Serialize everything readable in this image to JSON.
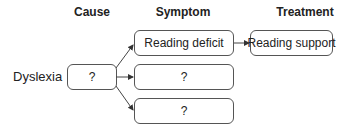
{
  "headers": {
    "cause": "Cause",
    "symptom": "Symptom",
    "treatment": "Treatment"
  },
  "condition_label": "Dyslexia",
  "cause_box": "?",
  "symptom_boxes": [
    "Reading deficit",
    "?",
    "?"
  ],
  "treatment_box": "Reading support"
}
